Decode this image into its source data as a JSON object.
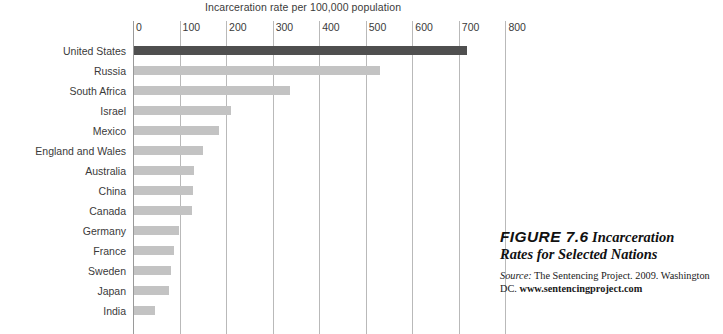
{
  "chart_data": {
    "type": "bar",
    "orientation": "horizontal",
    "title": "Incarceration rate per 100,000 population",
    "xlabel": "",
    "ylabel": "",
    "xlim": [
      0,
      800
    ],
    "xticks": [
      0,
      100,
      200,
      300,
      400,
      500,
      600,
      700,
      800
    ],
    "grid": true,
    "legend": null,
    "categories": [
      "United States",
      "Russia",
      "South Africa",
      "Israel",
      "Mexico",
      "England and Wales",
      "Australia",
      "China",
      "Canada",
      "Germany",
      "France",
      "Sweden",
      "Japan",
      "India"
    ],
    "values": [
      715,
      528,
      335,
      209,
      182,
      148,
      129,
      127,
      125,
      96,
      85,
      79,
      75,
      45
    ],
    "highlight_category": "United States",
    "colors": {
      "bar": "#c3c3c3",
      "bar_highlight": "#4f4f4f",
      "gridline": "#b9b9b9",
      "text": "#3a3a3a"
    }
  },
  "caption": {
    "figure_number": "FIGURE 7.6",
    "title": "Incarceration Rates for Selected Nations",
    "source_label": "Source:",
    "source_text": "The Sentencing Project. 2009. Washington DC.",
    "source_url": "www.sentencingproject.com"
  }
}
